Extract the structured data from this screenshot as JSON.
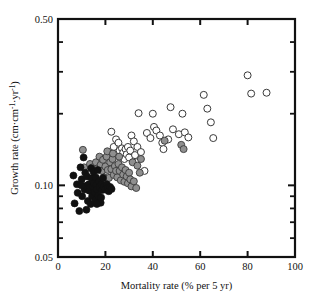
{
  "chart_data": {
    "type": "scatter",
    "title": "",
    "xlabel": "Mortality rate (% per 5 yr)",
    "ylabel": "Growth rate (cm·cm⁻¹·yr⁻¹)",
    "xlabel_parts": {
      "main": "Mortality rate (% per 5 yr)"
    },
    "ylabel_parts": {
      "pre": "Growth rate (cm·cm",
      "sup1": "-1",
      "mid": "·yr",
      "sup2": "-1",
      "post": ")"
    },
    "xscale": "linear",
    "yscale": "log",
    "xlim": [
      0,
      100
    ],
    "ylim": [
      0.05,
      0.5
    ],
    "grid": false,
    "legend": "none",
    "xticks": [
      0,
      20,
      40,
      60,
      80,
      100
    ],
    "xticklabels": [
      "0",
      "20",
      "40",
      "60",
      "80",
      "100"
    ],
    "yticks": [
      0.05,
      0.1,
      0.5
    ],
    "yticklabels": [
      "0.05",
      "0.10",
      "0.50"
    ],
    "yminorticks": [
      0.06,
      0.07,
      0.08,
      0.09,
      0.2,
      0.3,
      0.4
    ],
    "series": [
      {
        "name": "black-filled",
        "marker": "circle",
        "fill": "#111111",
        "edge": "#111111",
        "points": [
          [
            6.5,
            0.11
          ],
          [
            7.0,
            0.084
          ],
          [
            8.0,
            0.101
          ],
          [
            8.3,
            0.093
          ],
          [
            9.0,
            0.078
          ],
          [
            9.5,
            0.119
          ],
          [
            10.0,
            0.106
          ],
          [
            10.2,
            0.09
          ],
          [
            10.8,
            0.131
          ],
          [
            11.2,
            0.096
          ],
          [
            11.5,
            0.113
          ],
          [
            11.8,
            0.0995
          ],
          [
            12.3,
            0.109
          ],
          [
            12.6,
            0.086
          ],
          [
            13.0,
            0.101
          ],
          [
            13.2,
            0.095
          ],
          [
            13.6,
            0.0985
          ],
          [
            14.0,
            0.118
          ],
          [
            14.2,
            0.107
          ],
          [
            14.4,
            0.09
          ],
          [
            14.8,
            0.099
          ],
          [
            15.0,
            0.114
          ],
          [
            15.2,
            0.102
          ],
          [
            15.5,
            0.0935
          ],
          [
            15.8,
            0.087
          ],
          [
            16.0,
            0.108
          ],
          [
            16.2,
            0.1005
          ],
          [
            16.5,
            0.096
          ],
          [
            16.8,
            0.116
          ],
          [
            17.0,
            0.0905
          ],
          [
            17.4,
            0.104
          ],
          [
            17.6,
            0.0985
          ],
          [
            18.0,
            0.0845
          ],
          [
            18.4,
            0.101
          ],
          [
            18.6,
            0.0955
          ],
          [
            19.0,
            0.1075
          ],
          [
            19.4,
            0.099
          ],
          [
            20.0,
            0.096
          ],
          [
            20.6,
            0.101
          ],
          [
            21.0,
            0.0975
          ],
          [
            21.4,
            0.0945
          ],
          [
            22.0,
            0.0985
          ],
          [
            22.6,
            0.0965
          ],
          [
            12.0,
            0.079
          ],
          [
            13.8,
            0.0835
          ],
          [
            9.8,
            0.1
          ],
          [
            18.2,
            0.089
          ],
          [
            16.4,
            0.0835
          ]
        ]
      },
      {
        "name": "gray-filled",
        "marker": "circle",
        "fill": "#8f8f8f",
        "edge": "#3a3a3a",
        "points": [
          [
            10.5,
            0.141
          ],
          [
            11.0,
            0.119
          ],
          [
            13.5,
            0.123
          ],
          [
            14.5,
            0.119
          ],
          [
            16.0,
            0.125
          ],
          [
            16.8,
            0.118
          ],
          [
            17.5,
            0.132
          ],
          [
            18.0,
            0.122
          ],
          [
            18.6,
            0.115
          ],
          [
            19.0,
            0.128
          ],
          [
            19.5,
            0.108
          ],
          [
            20.0,
            0.12
          ],
          [
            20.5,
            0.132
          ],
          [
            21.0,
            0.116
          ],
          [
            21.5,
            0.1075
          ],
          [
            22.0,
            0.125
          ],
          [
            22.5,
            0.117
          ],
          [
            23.0,
            0.129
          ],
          [
            23.5,
            0.1105
          ],
          [
            24.0,
            0.1205
          ],
          [
            24.5,
            0.115
          ],
          [
            25.0,
            0.108
          ],
          [
            25.5,
            0.123
          ],
          [
            26.0,
            0.115
          ],
          [
            26.5,
            0.105
          ],
          [
            27.0,
            0.119
          ],
          [
            27.5,
            0.111
          ],
          [
            28.0,
            0.1035
          ],
          [
            28.5,
            0.116
          ],
          [
            29.0,
            0.109
          ],
          [
            29.5,
            0.102
          ],
          [
            30.0,
            0.113
          ],
          [
            30.5,
            0.106
          ],
          [
            31.0,
            0.099
          ],
          [
            32.0,
            0.104
          ],
          [
            33.0,
            0.0975
          ],
          [
            20.8,
            0.139
          ],
          [
            23.2,
            0.136
          ],
          [
            25.8,
            0.132
          ],
          [
            31.5,
            0.125
          ],
          [
            33.5,
            0.121
          ],
          [
            34.5,
            0.113
          ],
          [
            35.0,
            0.129
          ],
          [
            52.0,
            0.148
          ],
          [
            53.0,
            0.142
          ],
          [
            45.0,
            0.154
          ]
        ]
      },
      {
        "name": "open",
        "marker": "circle",
        "fill": "#ffffff",
        "edge": "#3a3a3a",
        "points": [
          [
            22.5,
            0.168
          ],
          [
            23.5,
            0.145
          ],
          [
            24.5,
            0.156
          ],
          [
            25.5,
            0.151
          ],
          [
            26.0,
            0.14
          ],
          [
            26.5,
            0.132
          ],
          [
            27.0,
            0.143
          ],
          [
            27.5,
            0.137
          ],
          [
            28.0,
            0.129
          ],
          [
            28.5,
            0.142
          ],
          [
            29.0,
            0.135
          ],
          [
            29.5,
            0.145
          ],
          [
            30.0,
            0.131
          ],
          [
            30.5,
            0.14
          ],
          [
            31.0,
            0.162
          ],
          [
            32.0,
            0.153
          ],
          [
            32.5,
            0.134
          ],
          [
            33.0,
            0.125
          ],
          [
            33.5,
            0.145
          ],
          [
            34.0,
            0.201
          ],
          [
            35.0,
            0.138
          ],
          [
            36.5,
            0.115
          ],
          [
            37.5,
            0.166
          ],
          [
            39.0,
            0.158
          ],
          [
            40.0,
            0.2
          ],
          [
            40.5,
            0.176
          ],
          [
            41.5,
            0.17
          ],
          [
            43.0,
            0.162
          ],
          [
            44.0,
            0.151
          ],
          [
            44.5,
            0.142
          ],
          [
            46.5,
            0.156
          ],
          [
            47.5,
            0.213
          ],
          [
            48.5,
            0.172
          ],
          [
            51.0,
            0.164
          ],
          [
            52.5,
            0.2
          ],
          [
            53.5,
            0.167
          ],
          [
            55.0,
            0.159
          ],
          [
            61.5,
            0.24
          ],
          [
            63.0,
            0.21
          ],
          [
            64.5,
            0.184
          ],
          [
            65.5,
            0.158
          ],
          [
            80.0,
            0.29
          ],
          [
            81.5,
            0.243
          ],
          [
            88.0,
            0.245
          ]
        ]
      }
    ]
  },
  "geometry": {
    "plot_left": 58,
    "plot_right": 295,
    "plot_top": 19,
    "plot_bottom": 257
  }
}
